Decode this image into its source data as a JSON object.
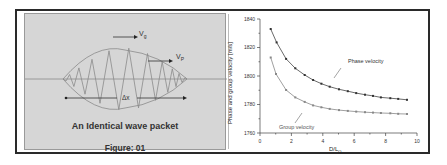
{
  "figure": {
    "left_panel": {
      "caption": "An Identical wave packet",
      "figure_label": "Figure: 01",
      "labels": {
        "group_velocity": "V",
        "group_sub": "g",
        "phase_velocity": "V",
        "phase_sub": "P",
        "width": "Δx"
      }
    },
    "right_panel": {
      "ylabel": "Phase and group velocity [m/s]",
      "xlabel": "D/L",
      "xlabel_sub": "O",
      "annotations": {
        "phase": "Phase velocity",
        "group": "Group velocity"
      }
    }
  },
  "chart_data": {
    "type": "line",
    "title": "",
    "xlabel": "D/L0",
    "ylabel": "Phase and group velocity [m/s]",
    "xlim": [
      0,
      10
    ],
    "ylim": [
      1760,
      1840
    ],
    "xticks": [
      0,
      2,
      4,
      6,
      8,
      10
    ],
    "yticks": [
      1760,
      1780,
      1800,
      1820,
      1840
    ],
    "grid": false,
    "legend": "inline annotations",
    "series": [
      {
        "name": "Phase velocity",
        "x": [
          0.68,
          1.06,
          1.66,
          2.25,
          2.85,
          3.38,
          3.91,
          4.44,
          5.03,
          5.59,
          6.13,
          6.69,
          7.2,
          7.7,
          8.3,
          8.8,
          9.36
        ],
        "y": [
          1833,
          1823.6,
          1812,
          1805.4,
          1800.7,
          1797.2,
          1794.6,
          1792.5,
          1790.7,
          1789.3,
          1788,
          1786.9,
          1786,
          1785,
          1784.4,
          1783.9,
          1783.3
        ]
      },
      {
        "name": "Group velocity",
        "x": [
          0.68,
          1.02,
          1.66,
          2.25,
          2.85,
          3.38,
          3.91,
          4.44,
          5.03,
          5.59,
          6.13,
          6.69,
          7.2,
          7.7,
          8.3,
          8.8,
          9.36
        ],
        "y": [
          1813,
          1801.4,
          1790.2,
          1785,
          1781.8,
          1779.4,
          1778,
          1776.9,
          1776.1,
          1775.5,
          1775,
          1774.6,
          1774.3,
          1774,
          1773.8,
          1773.5,
          1773.3
        ]
      }
    ]
  }
}
